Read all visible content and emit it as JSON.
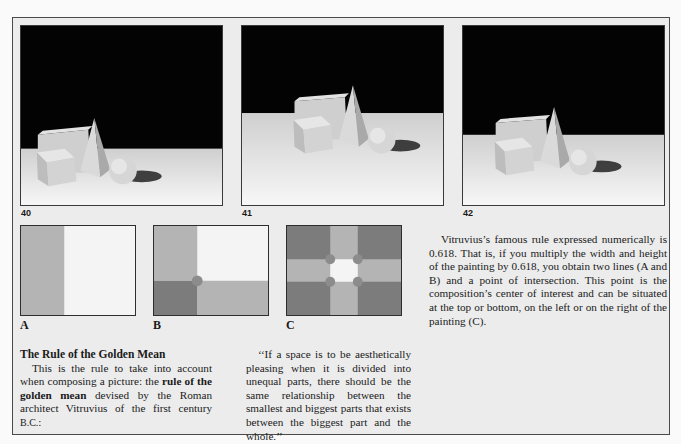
{
  "photos": [
    {
      "number": "40",
      "description": "Still life: cube, rectangular block, pyramid and sphere on a white surface against black background, objects placed low-left"
    },
    {
      "number": "41",
      "description": "Same still life centered in frame"
    },
    {
      "number": "42",
      "description": "Same still life placed at golden mean intersection"
    }
  ],
  "diagrams": [
    {
      "label": "A",
      "description": "Rectangle divided vertically at 0.618"
    },
    {
      "label": "B",
      "description": "Rectangle divided vertically and horizontally, point of intersection marked"
    },
    {
      "label": "C",
      "description": "Rectangle with four golden-mean intersection points marked"
    }
  ],
  "colors": {
    "panel_bg": "#ececec",
    "diagram_light": "#f4f4f4",
    "diagram_mid": "#b4b4b4",
    "diagram_dark": "#7c7c7c",
    "intersection_dot": "#8c8c8c"
  },
  "right_text": "Vitruvius’s famous rule expressed numerically is 0.618. That is, if you multiply the width and height of the painting by 0.618, you obtain two lines (A and B) and a point of intersection. This point is the composition’s center of interest and can be situated at the top or bottom, on the left or on the right of the painting (C).",
  "section": {
    "heading": "The Rule of the Golden Mean",
    "body_before_bold": "This is the rule to take into account when composing a picture: the ",
    "bold_term": "rule of the golden mean",
    "body_after_bold": " devised by the Roman architect Vitruvius of the first century ",
    "era": "B.C.",
    "trailing": ":"
  },
  "quote": "‘‘If a space is to be aesthetically pleasing when it is divided into unequal parts, there should be the same relationship between the smallest and biggest parts that exists between the biggest part and the whole.’’"
}
